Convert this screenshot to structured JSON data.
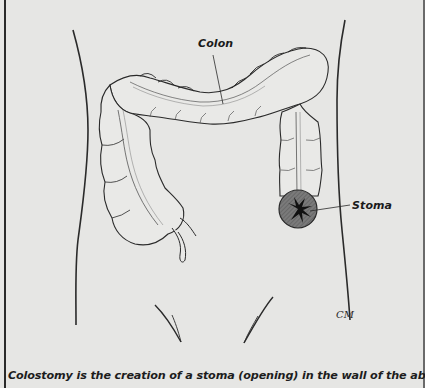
{
  "figure": {
    "labels": {
      "colon": "Colon",
      "stoma": "Stoma"
    },
    "signature": "CM",
    "caption": "Colostomy is the creation of a stoma (opening) in the wall of the abdomen to which"
  },
  "colors": {
    "background": "#e6e6e4",
    "line": "#2a2a2a",
    "stoma_fill": "#6e6e6e",
    "text": "#1a1a1a"
  }
}
